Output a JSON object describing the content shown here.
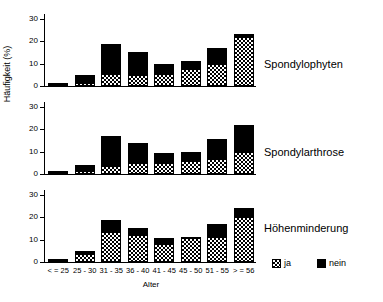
{
  "chart_data": {
    "type": "bar",
    "title": "",
    "subtitle": "",
    "xlabel": "Alter",
    "ylabel": "Häufigkeit (%)",
    "categories": [
      "< = 25",
      "25 - 30",
      "31 - 35",
      "36 - 40",
      "41 - 45",
      "45 - 50",
      "51 - 55",
      "> = 56"
    ],
    "ylim": [
      0,
      32
    ],
    "yticks": [
      0,
      10,
      20,
      30
    ],
    "ytick_labels": [
      "0",
      "10",
      "20",
      "30"
    ],
    "grid": false,
    "stacked": true,
    "legend_position": "bottom-right",
    "legend": [
      {
        "name": "ja",
        "pattern": "checkered"
      },
      {
        "name": "nein",
        "pattern": "solid-black"
      }
    ],
    "panels": [
      {
        "caption": "Spondylophyten",
        "series": [
          {
            "name": "ja",
            "values": [
              0.2,
              1.5,
              5.5,
              5.0,
              5.5,
              7.5,
              10.0,
              22.0
            ]
          },
          {
            "name": "nein",
            "values": [
              1.3,
              3.5,
              13.0,
              10.0,
              4.5,
              3.5,
              7.0,
              1.0
            ]
          }
        ],
        "totals": [
          1.5,
          5.0,
          18.5,
          15.0,
          10.0,
          11.0,
          17.0,
          23.0
        ]
      },
      {
        "caption": "Spondylarthrose",
        "series": [
          {
            "name": "ja",
            "values": [
              0.2,
              1.5,
              3.5,
              5.0,
              5.0,
              6.0,
              6.5,
              10.0
            ]
          },
          {
            "name": "nein",
            "values": [
              0.8,
              2.5,
              13.5,
              9.0,
              4.5,
              4.0,
              9.0,
              12.0
            ]
          }
        ],
        "totals": [
          1.0,
          4.0,
          17.0,
          14.0,
          9.5,
          10.0,
          15.5,
          22.0
        ]
      },
      {
        "caption": "Höhenminderung",
        "series": [
          {
            "name": "ja",
            "values": [
              1.0,
              3.5,
              13.5,
              12.0,
              8.0,
              10.5,
              11.0,
              20.0
            ]
          },
          {
            "name": "nein",
            "values": [
              0.5,
              1.5,
              5.0,
              3.0,
              2.5,
              0.5,
              6.0,
              4.0
            ]
          }
        ],
        "totals": [
          1.5,
          5.0,
          18.5,
          15.0,
          10.5,
          11.0,
          17.0,
          24.0
        ]
      }
    ]
  }
}
